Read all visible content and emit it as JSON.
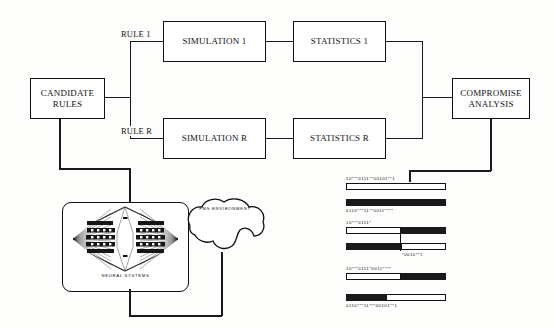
{
  "figure": {
    "type": "flow-diagram"
  },
  "flow": {
    "nodes": [
      {
        "id": "candidate-rules",
        "label": "CANDIDATE\nRULES"
      },
      {
        "id": "simulation-1",
        "label": "SIMULATION 1"
      },
      {
        "id": "statistics-1",
        "label": "STATISTICS 1"
      },
      {
        "id": "simulation-r",
        "label": "SIMULATION R"
      },
      {
        "id": "statistics-r",
        "label": "STATISTICS R"
      },
      {
        "id": "compromise-analysis",
        "label": "COMPROMISE\nANALYSIS"
      }
    ],
    "edge_labels": [
      {
        "id": "rule-1",
        "label": "RULE 1"
      },
      {
        "id": "rule-r",
        "label": "RULE R"
      }
    ]
  },
  "subsystem": {
    "neural_panel_caption": "NEURAL SYSTEMS",
    "environment_label": "FMS ENVIRONMENT"
  },
  "genetic": {
    "rows": [
      {
        "id": "parent-a-top",
        "text": "10***0111**00101**1",
        "text_pos": "above",
        "segments": [
          {
            "fill": "white",
            "width": 100
          }
        ]
      },
      {
        "id": "parent-b-top",
        "text": "0110***11**0011****",
        "text_pos": "below",
        "segments": [
          {
            "fill": "black",
            "width": 100
          }
        ]
      },
      {
        "id": "cross-a",
        "text": "10***0111*",
        "text_pos": "above",
        "segments": [
          {
            "fill": "white",
            "width": 55
          },
          {
            "fill": "black",
            "width": 45
          }
        ]
      },
      {
        "id": "cross-b",
        "text": "*0010**1",
        "text_pos": "below",
        "segments": [
          {
            "fill": "black",
            "width": 55
          },
          {
            "fill": "white",
            "width": 45
          }
        ]
      },
      {
        "id": "child-a",
        "text": "10***0111*0011****",
        "text_pos": "above",
        "segments": [
          {
            "fill": "white",
            "width": 55
          },
          {
            "fill": "black",
            "width": 45
          }
        ]
      },
      {
        "id": "child-b",
        "text": "0110***11***00101**1",
        "text_pos": "below",
        "segments": [
          {
            "fill": "black",
            "width": 40
          },
          {
            "fill": "white",
            "width": 60
          }
        ]
      }
    ]
  },
  "colors": {
    "ink": "#111111",
    "paper": "#fdfdfc",
    "bar_fill": "#1a1a1a"
  }
}
